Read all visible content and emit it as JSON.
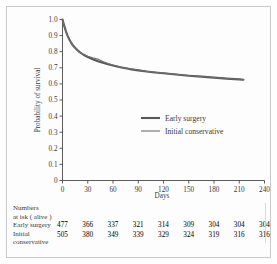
{
  "chart_data": {
    "type": "line",
    "title": "",
    "xlabel": "Days",
    "ylabel": "Probability of survival",
    "xlim": [
      0,
      240
    ],
    "ylim": [
      0,
      1.0
    ],
    "xticks": [
      "0",
      "30",
      "60",
      "90",
      "120",
      "150",
      "180",
      "210",
      "240"
    ],
    "yticks": [
      "0",
      "0.1",
      "0.2",
      "0.3",
      "0.4",
      "0.5",
      "0.6",
      "0.7",
      "0.8",
      "0.9",
      "1.0"
    ],
    "grid": false,
    "legend_position": "center-right",
    "series": [
      {
        "name": "Early surgery",
        "color": "#585858",
        "linewidth": 2.1,
        "x": [
          0,
          2,
          4,
          6,
          8,
          10,
          13,
          16,
          20,
          25,
          30,
          36,
          42,
          48,
          54,
          60,
          70,
          80,
          90,
          100,
          110,
          120,
          135,
          150,
          165,
          180,
          195,
          210,
          215
        ],
        "y": [
          1.0,
          0.962,
          0.928,
          0.9,
          0.877,
          0.858,
          0.835,
          0.818,
          0.799,
          0.781,
          0.767,
          0.753,
          0.741,
          0.731,
          0.722,
          0.714,
          0.702,
          0.692,
          0.684,
          0.677,
          0.671,
          0.666,
          0.658,
          0.651,
          0.645,
          0.639,
          0.633,
          0.628,
          0.626
        ]
      },
      {
        "name": "Initial conservative",
        "color": "#6e6e6e",
        "linewidth": 1.1,
        "x": [
          0,
          2,
          4,
          6,
          8,
          10,
          13,
          16,
          20,
          25,
          30,
          36,
          42,
          48,
          54,
          60,
          70,
          80,
          90,
          100,
          110,
          120,
          135,
          150,
          165,
          180,
          195,
          210,
          215
        ],
        "y": [
          1.0,
          0.958,
          0.924,
          0.897,
          0.874,
          0.856,
          0.833,
          0.817,
          0.798,
          0.783,
          0.771,
          0.762,
          0.754,
          0.739,
          0.727,
          0.717,
          0.704,
          0.694,
          0.686,
          0.678,
          0.672,
          0.667,
          0.659,
          0.652,
          0.646,
          0.64,
          0.634,
          0.629,
          0.627
        ]
      }
    ]
  },
  "legend": {
    "items": [
      {
        "label": "Early surgery"
      },
      {
        "label": "Initial conservative"
      }
    ]
  },
  "risk_table": {
    "heading_line1": "Numbers",
    "heading_line2": "at isk ( alive )",
    "rows": [
      {
        "label_line1": "Early surgery",
        "label_line2": "",
        "values": [
          "477",
          "366",
          "337",
          "321",
          "314",
          "309",
          "304",
          "304",
          "304"
        ]
      },
      {
        "label_line1": "Initial",
        "label_line2": "conservative",
        "values": [
          "505",
          "380",
          "349",
          "339",
          "329",
          "324",
          "319",
          "316",
          "316"
        ]
      }
    ]
  }
}
